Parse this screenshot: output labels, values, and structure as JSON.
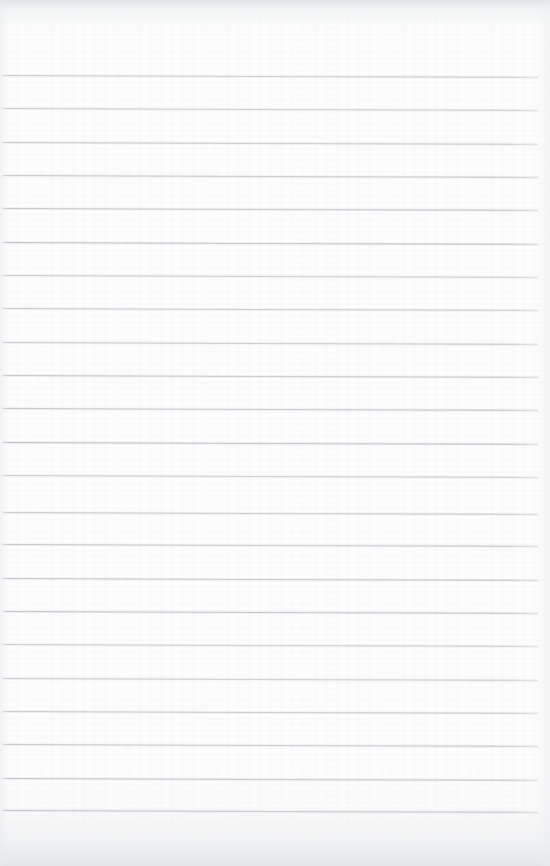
{
  "document": {
    "kind": "scanned-lined-notepad-page",
    "title": "Blank Lined Notepad Page",
    "content_text": "",
    "width_px": 550,
    "height_px": 866
  },
  "paper": {
    "background_color": "#fdfdfe",
    "edge_shadow_color": "#e2e4e6",
    "grain_color": "#eff0f2",
    "header_blank_height_px": 74,
    "footer_blank_height_px": 54
  },
  "ruling": {
    "line_color": "#b8bcc1",
    "line_thickness_px": 1,
    "line_count": 23,
    "first_line_y_px": 75,
    "last_line_y_px": 810,
    "line_spacing_px": 33.4,
    "line_start_x_px": 2,
    "line_end_x_px": 538,
    "right_margin_px": 12,
    "skew_px_across_page": 2,
    "lines": [
      {
        "index": 1,
        "y": 75,
        "x1": 2,
        "x2": 538,
        "content": ""
      },
      {
        "index": 2,
        "y": 108,
        "x1": 2,
        "x2": 538,
        "content": ""
      },
      {
        "index": 3,
        "y": 142,
        "x1": 2,
        "x2": 538,
        "content": ""
      },
      {
        "index": 4,
        "y": 175,
        "x1": 2,
        "x2": 538,
        "content": ""
      },
      {
        "index": 5,
        "y": 208,
        "x1": 2,
        "x2": 538,
        "content": ""
      },
      {
        "index": 6,
        "y": 242,
        "x1": 2,
        "x2": 538,
        "content": ""
      },
      {
        "index": 7,
        "y": 275,
        "x1": 2,
        "x2": 538,
        "content": ""
      },
      {
        "index": 8,
        "y": 308,
        "x1": 2,
        "x2": 538,
        "content": ""
      },
      {
        "index": 9,
        "y": 342,
        "x1": 2,
        "x2": 538,
        "content": ""
      },
      {
        "index": 10,
        "y": 375,
        "x1": 2,
        "x2": 538,
        "content": ""
      },
      {
        "index": 11,
        "y": 408,
        "x1": 2,
        "x2": 538,
        "content": ""
      },
      {
        "index": 12,
        "y": 442,
        "x1": 2,
        "x2": 538,
        "content": ""
      },
      {
        "index": 13,
        "y": 475,
        "x1": 2,
        "x2": 538,
        "content": ""
      },
      {
        "index": 14,
        "y": 512,
        "x1": 2,
        "x2": 538,
        "content": ""
      },
      {
        "index": 15,
        "y": 544,
        "x1": 2,
        "x2": 538,
        "content": ""
      },
      {
        "index": 16,
        "y": 578,
        "x1": 2,
        "x2": 538,
        "content": ""
      },
      {
        "index": 17,
        "y": 611,
        "x1": 2,
        "x2": 538,
        "content": ""
      },
      {
        "index": 18,
        "y": 644,
        "x1": 2,
        "x2": 538,
        "content": ""
      },
      {
        "index": 19,
        "y": 678,
        "x1": 2,
        "x2": 538,
        "content": ""
      },
      {
        "index": 20,
        "y": 711,
        "x1": 2,
        "x2": 538,
        "content": ""
      },
      {
        "index": 21,
        "y": 744,
        "x1": 2,
        "x2": 538,
        "content": ""
      },
      {
        "index": 22,
        "y": 778,
        "x1": 2,
        "x2": 538,
        "content": ""
      },
      {
        "index": 23,
        "y": 810,
        "x1": 2,
        "x2": 538,
        "content": ""
      }
    ]
  }
}
